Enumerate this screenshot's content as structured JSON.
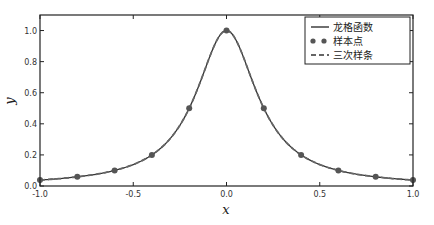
{
  "chart_data": {
    "type": "line",
    "title": "",
    "xlabel": "x",
    "ylabel": "y",
    "xlim": [
      -1.0,
      1.0
    ],
    "ylim": [
      0.0,
      1.1
    ],
    "grid": false,
    "legend_position": "upper right",
    "xticks": [
      "-1.0",
      "-0.5",
      "0.0",
      "0.5",
      "1.0"
    ],
    "xtick_values": [
      -1.0,
      -0.5,
      0.0,
      0.5,
      1.0
    ],
    "yticks": [
      "0.0",
      "0.2",
      "0.4",
      "0.6",
      "0.8",
      "1.0"
    ],
    "ytick_values": [
      0.0,
      0.2,
      0.4,
      0.6,
      0.8,
      1.0
    ],
    "series": [
      {
        "name": "龙格函数",
        "style": "solid-line",
        "function": "1/(1+25x^2)",
        "x": [
          -1.0,
          -0.8,
          -0.6,
          -0.4,
          -0.2,
          0.0,
          0.2,
          0.4,
          0.6,
          0.8,
          1.0
        ],
        "values": [
          0.038,
          0.059,
          0.1,
          0.2,
          0.5,
          1.0,
          0.5,
          0.2,
          0.1,
          0.059,
          0.038
        ]
      },
      {
        "name": "样本点",
        "style": "markers",
        "x": [
          -1.0,
          -0.8,
          -0.6,
          -0.4,
          -0.2,
          0.0,
          0.2,
          0.4,
          0.6,
          0.8,
          1.0
        ],
        "values": [
          0.038,
          0.059,
          0.1,
          0.2,
          0.5,
          1.0,
          0.5,
          0.2,
          0.1,
          0.059,
          0.038
        ]
      },
      {
        "name": "三次样条",
        "style": "dashed-line",
        "x": [
          -1.0,
          -0.8,
          -0.6,
          -0.4,
          -0.2,
          0.0,
          0.2,
          0.4,
          0.6,
          0.8,
          1.0
        ],
        "values": [
          0.038,
          0.059,
          0.1,
          0.2,
          0.5,
          1.0,
          0.5,
          0.2,
          0.1,
          0.059,
          0.038
        ]
      }
    ]
  },
  "legend": {
    "items": [
      {
        "label": "龙格函数",
        "icon": "solid-line"
      },
      {
        "label": "样本点",
        "icon": "dot-markers"
      },
      {
        "label": "三次样条",
        "icon": "dashed-line"
      }
    ]
  },
  "colors": {
    "line": "#444444",
    "marker": "#555555",
    "axes": "#222222"
  }
}
